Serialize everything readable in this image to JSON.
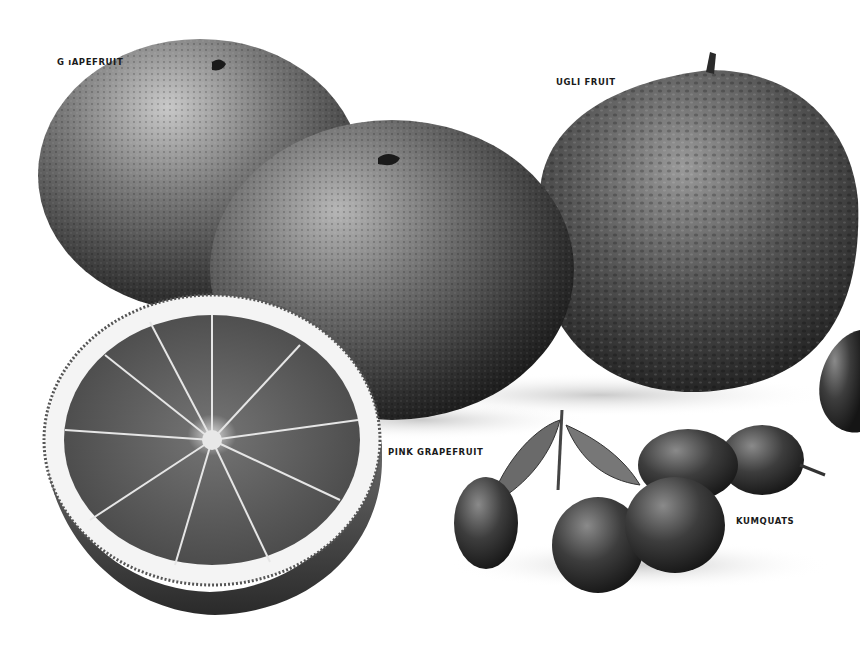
{
  "illustration": {
    "style": "monochrome botanical pencil illustration of citrus fruits",
    "background_color": "#ffffff",
    "ink_color": "#1a1a1a"
  },
  "labels": {
    "grapefruit": "G ıAPEFRUIT",
    "ugli_fruit": "UGLI FRUIT",
    "pink_grapefruit": "PINK GRAPEFRUIT",
    "kumquats": "KUMQUATS"
  },
  "fruits": [
    {
      "name": "grapefruit",
      "form": "whole"
    },
    {
      "name": "pink grapefruit",
      "form": "whole"
    },
    {
      "name": "pink grapefruit",
      "form": "halved cross-section"
    },
    {
      "name": "ugli fruit",
      "form": "whole"
    },
    {
      "name": "kumquats",
      "form": "cluster of five with leaves"
    }
  ]
}
